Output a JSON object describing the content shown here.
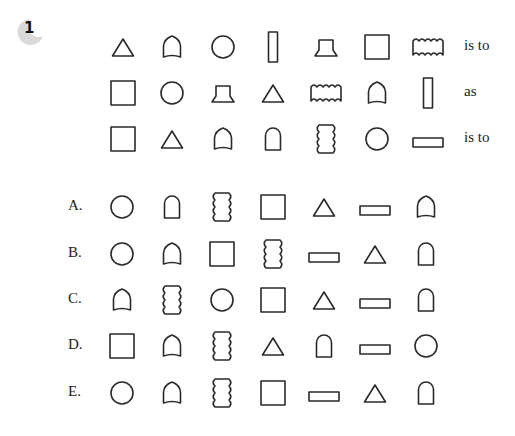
{
  "question": {
    "number": "1",
    "rows": [
      {
        "shapes": [
          "triangle",
          "pointed-arch",
          "circle",
          "tall-rectangle",
          "pedestal",
          "square",
          "wavy-horizontal-rectangle"
        ],
        "connector": "is to"
      },
      {
        "shapes": [
          "square",
          "circle",
          "pedestal",
          "triangle",
          "wavy-horizontal-rectangle",
          "pointed-arch",
          "tall-rectangle"
        ],
        "connector": "as"
      },
      {
        "shapes": [
          "square",
          "triangle",
          "pointed-arch",
          "round-arch",
          "wavy-vertical-rectangle",
          "circle",
          "flat-rectangle"
        ],
        "connector": "is to"
      }
    ]
  },
  "options": [
    {
      "label": "A.",
      "shapes": [
        "circle",
        "round-arch",
        "wavy-vertical-rectangle",
        "square",
        "triangle",
        "flat-rectangle",
        "pointed-arch"
      ]
    },
    {
      "label": "B.",
      "shapes": [
        "circle",
        "pointed-arch",
        "square",
        "wavy-vertical-rectangle",
        "flat-rectangle",
        "triangle",
        "round-arch"
      ]
    },
    {
      "label": "C.",
      "shapes": [
        "pointed-arch",
        "wavy-vertical-rectangle",
        "circle",
        "square",
        "triangle",
        "flat-rectangle",
        "round-arch"
      ]
    },
    {
      "label": "D.",
      "shapes": [
        "square",
        "pointed-arch",
        "wavy-vertical-rectangle",
        "triangle",
        "round-arch",
        "flat-rectangle",
        "circle"
      ]
    },
    {
      "label": "E.",
      "shapes": [
        "circle",
        "pointed-arch",
        "wavy-vertical-rectangle",
        "square",
        "flat-rectangle",
        "triangle",
        "round-arch"
      ]
    }
  ],
  "colors": {
    "stroke": "#2a2a2a",
    "badge": "#d9d9d9"
  }
}
